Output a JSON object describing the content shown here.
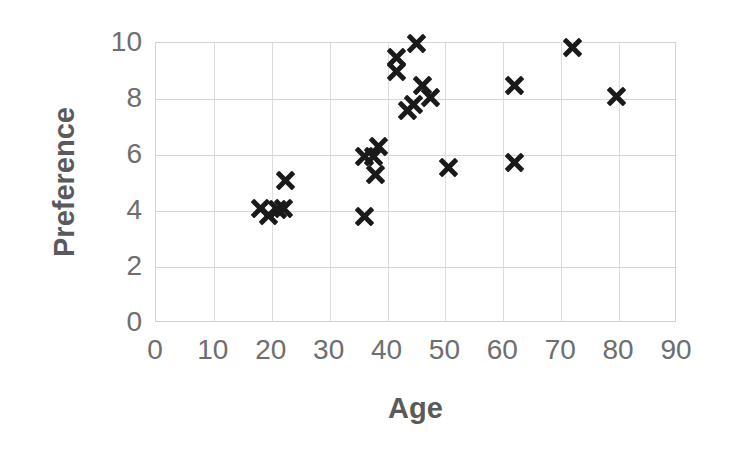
{
  "chart_data": {
    "type": "scatter",
    "title": "",
    "xlabel": "Age",
    "ylabel": "Preference",
    "xlim": [
      0,
      90
    ],
    "ylim": [
      0,
      10
    ],
    "xticks": [
      0,
      10,
      20,
      30,
      40,
      50,
      60,
      70,
      80,
      90
    ],
    "yticks": [
      0,
      2,
      4,
      6,
      8,
      10
    ],
    "grid": true,
    "legend": null,
    "marker": "x",
    "marker_color": "#1a1a1a",
    "axis_text_color": "#6e6e6e",
    "axis_title_color": "#5a5a5a",
    "gridline_color": "#d6d6d6",
    "background_color": "#ffffff",
    "points": [
      {
        "x": 18.0,
        "y": 4.1
      },
      {
        "x": 19.5,
        "y": 3.85
      },
      {
        "x": 21.0,
        "y": 4.05
      },
      {
        "x": 22.0,
        "y": 4.1
      },
      {
        "x": 22.3,
        "y": 5.1
      },
      {
        "x": 36.0,
        "y": 5.95
      },
      {
        "x": 36.0,
        "y": 3.8
      },
      {
        "x": 37.5,
        "y": 5.95
      },
      {
        "x": 38.5,
        "y": 6.3
      },
      {
        "x": 38.0,
        "y": 5.3
      },
      {
        "x": 41.5,
        "y": 9.5
      },
      {
        "x": 41.5,
        "y": 9.0
      },
      {
        "x": 43.5,
        "y": 7.6
      },
      {
        "x": 44.5,
        "y": 7.8
      },
      {
        "x": 45.0,
        "y": 10.0
      },
      {
        "x": 46.0,
        "y": 8.5
      },
      {
        "x": 47.5,
        "y": 8.05
      },
      {
        "x": 50.5,
        "y": 5.55
      },
      {
        "x": 62.0,
        "y": 8.5
      },
      {
        "x": 62.0,
        "y": 5.75
      },
      {
        "x": 72.0,
        "y": 9.85
      },
      {
        "x": 79.5,
        "y": 8.1
      }
    ]
  }
}
